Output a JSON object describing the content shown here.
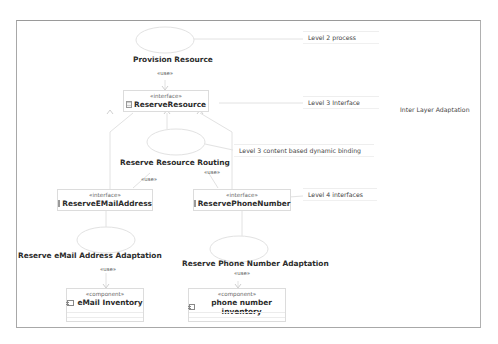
{
  "diagram": {
    "type": "UML use case / component diagram",
    "usecases": [
      {
        "id": "provision_resource",
        "label": "Provision Resource"
      },
      {
        "id": "reserve_resource_routing",
        "label": "Reserve Resource Routing"
      },
      {
        "id": "reserve_email_adaptation",
        "label": "Reserve eMail Address Adaptation"
      },
      {
        "id": "reserve_phone_adaptation",
        "label": "Reserve Phone Number Adaptation"
      }
    ],
    "interfaces": [
      {
        "id": "reserve_resource",
        "stereotype": "«interface»",
        "name": "ReserveResource"
      },
      {
        "id": "reserve_email",
        "stereotype": "«interface»",
        "name": "ReserveEMailAddress"
      },
      {
        "id": "reserve_phone",
        "stereotype": "«interface»",
        "name": "ReservePhoneNumber"
      }
    ],
    "components": [
      {
        "id": "email_inventory",
        "stereotype": "«component»",
        "name": "eMail Inventory"
      },
      {
        "id": "phone_inventory",
        "stereotype": "«component»",
        "name": "phone number inventory"
      }
    ],
    "dependencies": [
      {
        "from": "provision_resource",
        "to": "reserve_resource",
        "label": "«use»"
      },
      {
        "from": "reserve_resource_routing",
        "to": "reserve_email",
        "label": "«use»"
      },
      {
        "from": "reserve_resource_routing",
        "to": "reserve_phone",
        "label": "«use»"
      },
      {
        "from": "reserve_email_adaptation",
        "to": "email_inventory",
        "label": "«use»"
      },
      {
        "from": "reserve_phone_adaptation",
        "to": "phone_inventory",
        "label": "«use»"
      }
    ],
    "notes": [
      {
        "id": "level2",
        "text": "Level 2 process"
      },
      {
        "id": "level3_if",
        "text": "Level 3 Interface"
      },
      {
        "id": "level3_binding",
        "text": "Level 3 content based dynamic binding"
      },
      {
        "id": "level4",
        "text": "Level 4 interfaces"
      }
    ],
    "free_text": {
      "inter_layer": "Inter Layer Adaptation"
    }
  }
}
